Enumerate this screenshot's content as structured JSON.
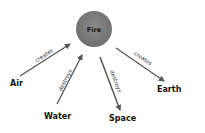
{
  "diagram": {
    "center": {
      "label": "Fire",
      "cx": 94,
      "cy": 29,
      "r": 18,
      "color": "#7a7a7a"
    },
    "nodes": [
      {
        "id": "air",
        "label": "Air",
        "x": 10,
        "y": 86
      },
      {
        "id": "water",
        "label": "Water",
        "x": 44,
        "y": 119
      },
      {
        "id": "space",
        "label": "Space",
        "x": 109,
        "y": 121
      },
      {
        "id": "earth",
        "label": "Earth",
        "x": 157,
        "y": 92
      }
    ],
    "edges": [
      {
        "from": "Air",
        "to": "Fire",
        "label": "creates"
      },
      {
        "from": "Water",
        "to": "Fire",
        "label": "destroys"
      },
      {
        "from": "Fire",
        "to": "Space",
        "label": "destroys"
      },
      {
        "from": "Fire",
        "to": "Earth",
        "label": "creates"
      }
    ],
    "arrow_color": "#555555"
  }
}
